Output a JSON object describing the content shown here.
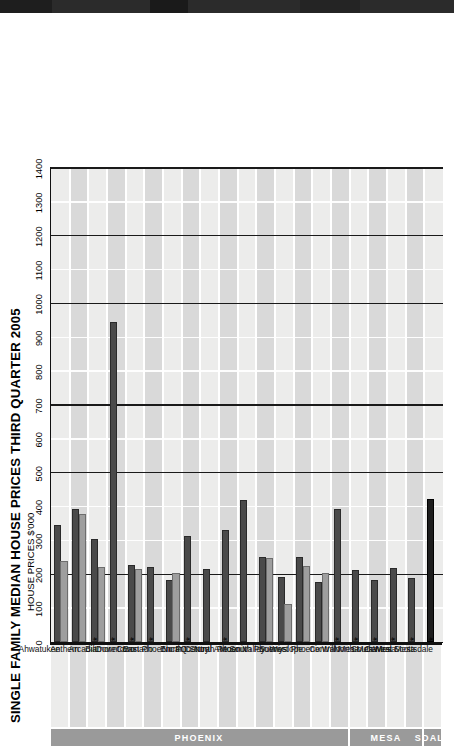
{
  "chart_data": {
    "type": "bar",
    "orientation": "horizontal-rotated",
    "title": "SINGLE FAMILY MEDIAN HOUSE PRICES THIRD QUARTER 2005",
    "subtitle": "HOUSE PRICES $'000",
    "xlabel": "",
    "ylabel": "HOUSE PRICES $'000",
    "axis_min": 0,
    "axis_max": 1400,
    "tick_step": 100,
    "ticks": [
      0,
      100,
      200,
      300,
      400,
      500,
      600,
      700,
      800,
      900,
      1000,
      1100,
      1200,
      1300,
      1400
    ],
    "grid": true,
    "major_gridlines": [
      200,
      500,
      700,
      1000,
      1200,
      1400
    ],
    "legend": [],
    "categories": [
      "Ahwatukee",
      "Anthem",
      "Arcadia",
      "Biltmore",
      "Downtown",
      "Coronado",
      "East Phoenix",
      "Encanto",
      "FQ Story",
      "North Central Ave",
      "North Phoenix",
      "Moon Valley",
      "South Phoenix",
      "Sunnyslope",
      "West Phoenix",
      "Willo",
      "Central Mesa",
      "North Mesa",
      "South Mesa",
      "West Mesa",
      "Central Scottsdale"
    ],
    "starred_categories": [
      "Arcadia",
      "Biltmore",
      "Downtown",
      "Coronado",
      "Encanto",
      "North Central Ave",
      "Willo",
      "Central Mesa",
      "North Mesa",
      "South Mesa",
      "West Mesa",
      "Central Scottsdale"
    ],
    "series": [
      {
        "name": "Series A",
        "style": "dark",
        "values": [
          345,
          393,
          305,
          945,
          228,
          222,
          182,
          312,
          215,
          332,
          420,
          252,
          193,
          250,
          178,
          393,
          212,
          183,
          220,
          190,
          422
        ]
      },
      {
        "name": "Series B",
        "style": "light",
        "values": [
          240,
          378,
          222,
          0,
          215,
          0,
          205,
          0,
          0,
          0,
          0,
          248,
          113,
          225,
          205,
          0,
          0,
          0,
          0,
          0,
          0
        ]
      }
    ],
    "groups": [
      {
        "label": "PHOENIX",
        "from": "Ahwatukee",
        "to": "Willo",
        "start_index": 0,
        "end_index": 15
      },
      {
        "label": "MESA",
        "from": "Central Mesa",
        "to": "West Mesa",
        "start_index": 16,
        "end_index": 19
      },
      {
        "label": "SDALE",
        "from": "Central Scottsdale",
        "to": "Central Scottsdale",
        "start_index": 20,
        "end_index": 20
      }
    ],
    "colors": {
      "series_a": "#4a4a4a",
      "series_b": "#9e9e9e",
      "plot_background": "#d9d9d9",
      "band_background": "#ececeb",
      "gridline_major": "#1a1a1a",
      "gridline_minor": "#ffffff",
      "group_band": "#9a9a9a"
    }
  }
}
